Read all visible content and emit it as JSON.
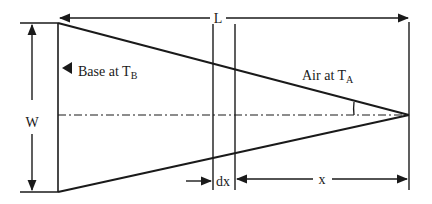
{
  "diagram": {
    "type": "triangular-fin-schematic",
    "colors": {
      "stroke": "#1a1a1a",
      "background": "#ffffff"
    },
    "labels": {
      "length": "L",
      "width": "W",
      "base_prefix": "Base at T",
      "base_sub": "B",
      "air_prefix": "Air at T",
      "air_sub": "A",
      "element": "dx",
      "distance": "x"
    },
    "geometry": {
      "base_x": 58,
      "tip": [
        409,
        115
      ],
      "top_y": 23,
      "bottom_y": 192,
      "element_x1": 213,
      "element_x2": 235
    }
  }
}
